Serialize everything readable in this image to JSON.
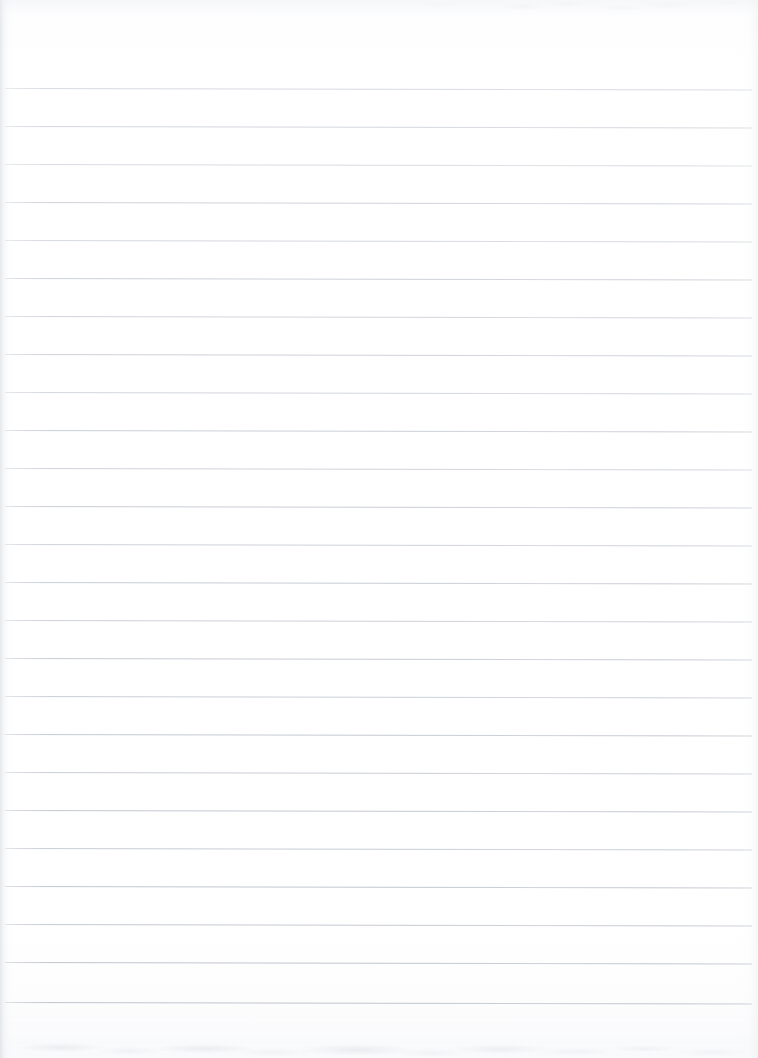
{
  "document": {
    "kind": "scanned-lined-paper",
    "title": "Blank Ruled Notebook Page",
    "page_width": 758,
    "page_height": 1058,
    "content_text": "",
    "is_blank": true
  },
  "paper": {
    "background_color": "#fefefe",
    "edge_shadow_color": "#d0d4da",
    "texture_note": "faint mottled scanner artifacts along top and bottom edges"
  },
  "ruling": {
    "line_color": "#b9bfc9",
    "line_thickness_px": 1,
    "line_count": 25,
    "first_line_y": 88,
    "line_spacing_px": 38.0,
    "line_start_x": 5,
    "line_end_x": 752,
    "tilt_degrees": 0.12,
    "line_y_positions": [
      88,
      126,
      164,
      202,
      240,
      278,
      316,
      354,
      392,
      430,
      468,
      506,
      544,
      582,
      620,
      658,
      696,
      734,
      772,
      810,
      848,
      886,
      924,
      962,
      1002
    ],
    "line_opacities": [
      0.58,
      0.62,
      0.55,
      0.68,
      0.6,
      0.72,
      0.66,
      0.7,
      0.64,
      0.74,
      0.68,
      0.76,
      0.7,
      0.78,
      0.72,
      0.8,
      0.74,
      0.82,
      0.76,
      0.84,
      0.78,
      0.86,
      0.82,
      0.88,
      0.9
    ]
  },
  "margins": {
    "top_blank_px": 88,
    "bottom_blank_px": 56,
    "left_edge_shade_px": 14,
    "right_edge_shade_px": 18
  }
}
